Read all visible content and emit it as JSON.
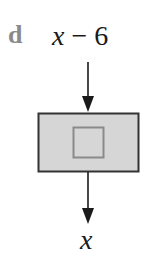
{
  "figure": {
    "part_label": "d",
    "input": {
      "variable": "x",
      "operator": " − ",
      "constant": "6"
    },
    "output": {
      "variable": "x"
    },
    "machine": {
      "description": "function machine box with inner square",
      "fill_color": "#d6d6d6",
      "border_color": "#333333",
      "inner_square_color": "#8a8a8a"
    },
    "arrow_color": "#1a1a1a"
  }
}
